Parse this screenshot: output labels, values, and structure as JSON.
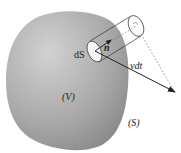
{
  "figure": {
    "labels": {
      "surface_element": "dS",
      "normal": "n",
      "displacement": "vdt",
      "volume": "(V)",
      "surface": "(S)"
    },
    "colors": {
      "volume_fill_light": "#c9c9c9",
      "volume_fill_dark": "#8a8a8a",
      "line": "#333333",
      "element_fill": "#f4f4f4"
    }
  }
}
